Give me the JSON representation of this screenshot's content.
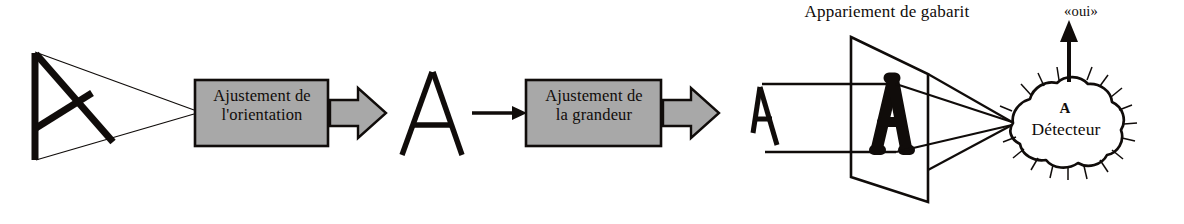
{
  "figure": {
    "title": "Appariement de gabarit",
    "stages": [
      {
        "id": "stage-orientation",
        "label": "Ajustement de\nl'orientation"
      },
      {
        "id": "stage-size",
        "label": "Ajustement de\nla grandeur"
      }
    ],
    "template_matching": {
      "caption": "Appariement de gabarit",
      "template_letter": "A"
    },
    "detector": {
      "letter": "A",
      "name": "Détecteur",
      "output_label": "«oui»"
    },
    "stimuli": {
      "rotated_letter": "A",
      "upright_letter": "A",
      "scaled_letter": "A"
    },
    "colors": {
      "box_fill": "#a8a8a8",
      "arrow_fill": "#a8a8a8",
      "stroke": "#100c0a",
      "background": "#ffffff"
    }
  }
}
